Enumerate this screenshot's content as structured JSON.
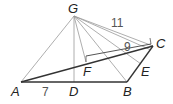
{
  "diagram": {
    "type": "geometry-pyramid",
    "points": {
      "G": {
        "label": "G",
        "x": 74,
        "y": 16
      },
      "A": {
        "label": "A",
        "x": 21,
        "y": 82
      },
      "D": {
        "label": "D",
        "x": 74,
        "y": 82
      },
      "B": {
        "label": "B",
        "x": 127,
        "y": 82
      },
      "C": {
        "label": "C",
        "x": 153,
        "y": 46
      },
      "E": {
        "label": "E",
        "x": 141,
        "y": 64
      },
      "F": {
        "label": "F",
        "x": 86,
        "y": 62
      }
    },
    "measures": {
      "AD": "7",
      "GC": "11",
      "FC": "9"
    },
    "colors": {
      "thin_line": "#999999",
      "thick_line": "#333333",
      "label": "#222222",
      "number": "#555555"
    }
  }
}
